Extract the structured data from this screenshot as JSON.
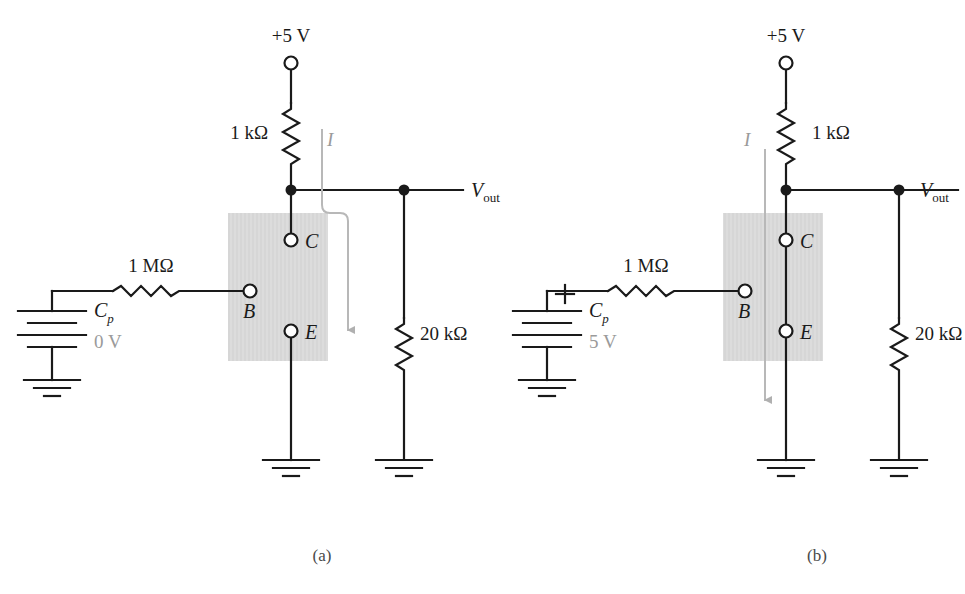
{
  "figure": {
    "line_color": "#1a1a1a",
    "gray_color": "#9a9a9a",
    "box_fill": "#d9d9d9",
    "caption_color": "#4a4a4a"
  },
  "panels": [
    {
      "id": "a",
      "caption": "(a)",
      "supply_label": "+5 V",
      "pullup_resistor": "1 kΩ",
      "base_resistor": "1 MΩ",
      "pulldown_resistor": "20 kΩ",
      "output_label_main": "V",
      "output_label_sub": "out",
      "current_label": "I",
      "cap_label_main": "C",
      "cap_label_sub": "p",
      "cap_voltage": "0 V",
      "cap_polarity": "",
      "terminals": {
        "base": "B",
        "collector": "C",
        "emitter": "E"
      }
    },
    {
      "id": "b",
      "caption": "(b)",
      "supply_label": "+5 V",
      "pullup_resistor": "1 kΩ",
      "base_resistor": "1 MΩ",
      "pulldown_resistor": "20 kΩ",
      "output_label_main": "V",
      "output_label_sub": "out",
      "current_label": "I",
      "cap_label_main": "C",
      "cap_label_sub": "p",
      "cap_voltage": "5 V",
      "cap_polarity": "+",
      "terminals": {
        "base": "B",
        "collector": "C",
        "emitter": "E"
      }
    }
  ]
}
